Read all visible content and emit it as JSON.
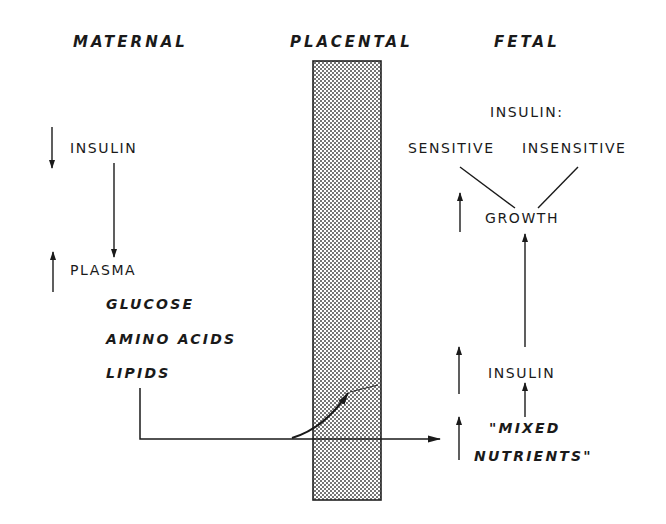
{
  "headers": {
    "maternal": "MATERNAL",
    "placental": "PLACENTAL",
    "fetal": "FETAL"
  },
  "maternal": {
    "insulin": {
      "label": "INSULIN",
      "direction": "decrease",
      "direction_icon": "arrow-down-icon"
    },
    "plasma": {
      "label": "PLASMA",
      "direction": "increase",
      "direction_icon": "arrow-up-icon"
    },
    "nutrients": [
      "GLUCOSE",
      "AMINO ACIDS",
      "LIPIDS"
    ]
  },
  "fetal": {
    "insulin_header": "INSULIN:",
    "sensitive": "SENSITIVE",
    "insensitive": "INSENSITIVE",
    "growth": {
      "label": "GROWTH",
      "direction": "increase"
    },
    "insulin": {
      "label": "INSULIN",
      "direction": "increase"
    },
    "mixed_nutrients_line1": "\"MIXED",
    "mixed_nutrients_line2": "NUTRIENTS\"",
    "mixed_nutrients_direction": "increase"
  },
  "placenta": {
    "fill": "stipple",
    "fill_color": "#9a9a9a",
    "border_color": "#222222"
  },
  "colors": {
    "ink": "#1a1a1a",
    "background": "#ffffff"
  }
}
